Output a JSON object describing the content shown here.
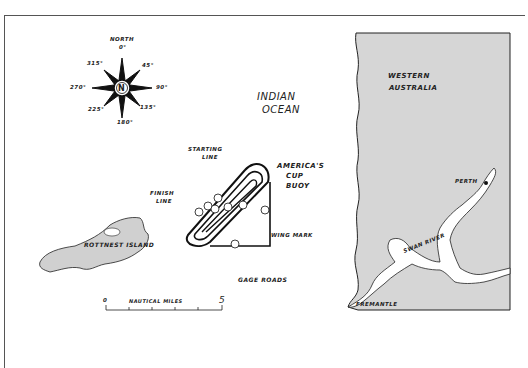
{
  "map": {
    "compass": {
      "north_label": "NORTH",
      "center_label": "N",
      "bearings": [
        "0°",
        "45°",
        "90°",
        "135°",
        "180°",
        "225°",
        "270°",
        "315°"
      ]
    },
    "ocean_label": [
      "INDIAN",
      "OCEAN"
    ],
    "course": {
      "starting_line": [
        "STARTING",
        "LINE"
      ],
      "finish_line": [
        "FINISH",
        "LINE"
      ],
      "buoy": [
        "AMERICA'S",
        "CUP",
        "BUOY"
      ],
      "wing_mark": "WING MARK",
      "legs": [
        "1",
        "2",
        "3",
        "4",
        "5",
        "6",
        "7",
        "8"
      ]
    },
    "island_label": "ROTTNEST ISLAND",
    "gage_roads": "GAGE ROADS",
    "scale": {
      "start": "0",
      "label": "NAUTICAL MILES",
      "end": "5"
    },
    "region_label": [
      "WESTERN",
      "AUSTRALIA"
    ],
    "perth": "PERTH",
    "swan_river": "SWAN RIVER",
    "fremantle": "FREMANTLE",
    "colors": {
      "land": "#d6d6d6",
      "ink": "#1a1a1a",
      "paper": "#ffffff"
    }
  }
}
